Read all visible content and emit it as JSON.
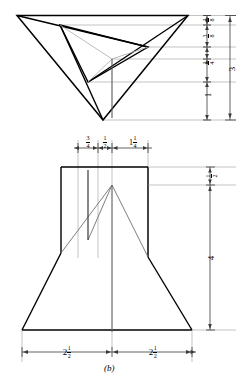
{
  "figure": {
    "caption": "(b)",
    "type": "orthographic-projection-drawing",
    "views": [
      {
        "name": "top-view",
        "description": "triangular pyramid top view with inner rotated triangle"
      },
      {
        "name": "front-view",
        "description": "trapezoidal front view with rectangular upper block"
      }
    ]
  },
  "dimensions": {
    "top_view_right_stack": [
      {
        "id": "dim-3-8-upper",
        "whole": "",
        "num": "3",
        "den": "8",
        "text": "3/8"
      },
      {
        "id": "dim-3-8-lower",
        "whole": "",
        "num": "3",
        "den": "8",
        "text": "3/8"
      },
      {
        "id": "dim-3-4",
        "whole": "",
        "num": "3",
        "den": "4",
        "text": "3/4"
      },
      {
        "id": "dim-1",
        "whole": "1",
        "num": "",
        "den": "",
        "text": "1"
      }
    ],
    "top_view_overall": {
      "id": "dim-3-overall",
      "whole": "3",
      "num": "",
      "den": "",
      "text": "3"
    },
    "front_view_top_row": [
      {
        "id": "dim-top-3-4",
        "whole": "",
        "num": "3",
        "den": "4",
        "text": "3/4"
      },
      {
        "id": "dim-top-1-2",
        "whole": "",
        "num": "1",
        "den": "2",
        "text": "1/2"
      },
      {
        "id": "dim-top-1-1-4",
        "whole": "1",
        "num": "1",
        "den": "4",
        "text": "1 1/4"
      }
    ],
    "front_view_right": [
      {
        "id": "dim-right-1-2",
        "whole": "",
        "num": "1",
        "den": "2",
        "text": "1/2"
      },
      {
        "id": "dim-right-4",
        "whole": "4",
        "num": "",
        "den": "",
        "text": "4"
      }
    ],
    "front_view_bottom": [
      {
        "id": "dim-bottom-left-2-1-2",
        "whole": "2",
        "num": "1",
        "den": "2",
        "text": "2 1/2"
      },
      {
        "id": "dim-bottom-right-2-1-2",
        "whole": "2",
        "num": "1",
        "den": "2",
        "text": "2 1/2"
      }
    ]
  },
  "colors": {
    "object_line": "#000000",
    "extension_line": "#8a8a8a",
    "dimension_line": "#4d4d4d",
    "hidden_line": "#6e6e6e",
    "background": "#ffffff"
  }
}
